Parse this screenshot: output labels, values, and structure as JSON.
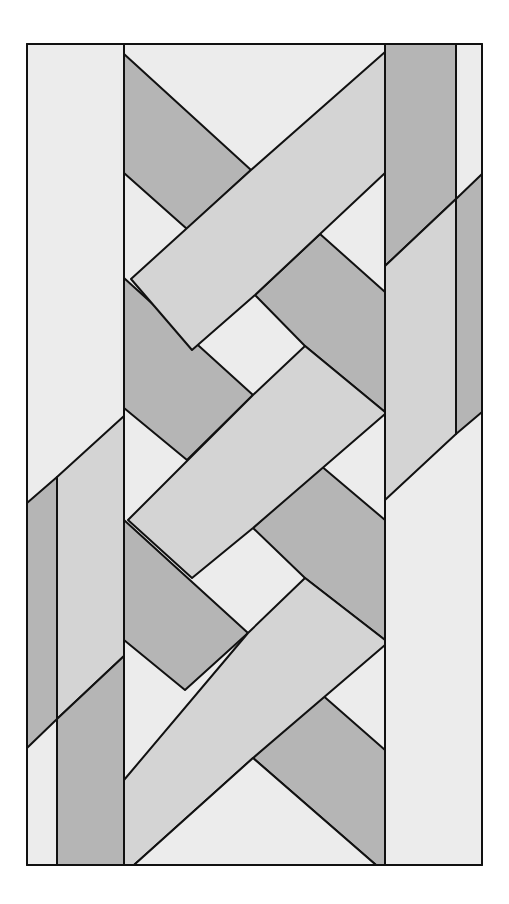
{
  "figure": {
    "title": "",
    "frame": {
      "x": 27,
      "y": 44,
      "width": 455,
      "height": 821
    },
    "colors": {
      "light": "#ececec",
      "medium": "#d4d4d4",
      "dark": "#b5b5b5",
      "line": "#111111",
      "background": "#ffffff"
    },
    "columns": {
      "left_outer": {
        "x1": 27,
        "x2": 124
      },
      "left_stripe_line_x": 57,
      "center": {
        "x1": 124,
        "x2": 385
      },
      "right_outer": {
        "x1": 385,
        "x2": 482
      },
      "right_stripe_line_x": 456
    },
    "shapes": [
      {
        "id": "left-bg",
        "tone": "light",
        "points": "27,44 124,44 124,865 27,865"
      },
      {
        "id": "left-band-dark-top",
        "tone": "dark",
        "points": "27,503 57,477 57,719 27,748"
      },
      {
        "id": "left-band-medium-top",
        "tone": "medium",
        "points": "57,477 124,416 124,656 57,719"
      },
      {
        "id": "left-band-dark-bottom",
        "tone": "dark",
        "points": "57,719 124,656 124,865 57,865"
      },
      {
        "id": "right-bg",
        "tone": "light",
        "points": "385,44 482,44 482,865 385,865"
      },
      {
        "id": "right-band-dark",
        "tone": "dark",
        "points": "385,44 456,44 456,199 385,266"
      },
      {
        "id": "right-band-dark-thin",
        "tone": "dark",
        "points": "456,199 482,174 482,412 456,434"
      },
      {
        "id": "right-band-medium",
        "tone": "medium",
        "points": "385,266 456,199 456,434 385,500"
      },
      {
        "id": "center-bg",
        "tone": "light",
        "points": "124,44 385,44 385,865 124,865"
      },
      {
        "id": "dark-tl",
        "tone": "dark",
        "points": "124,54 251,170 187,229 124,173"
      },
      {
        "id": "band-a",
        "tone": "medium",
        "points": "385,52 385,173 255,295 192,350 131,279 251,170"
      },
      {
        "id": "dark-r1",
        "tone": "dark",
        "points": "320,234 385,292 385,412 305,346 255,295"
      },
      {
        "id": "dark-l2",
        "tone": "dark",
        "points": "124,278 253,395 187,460 124,408"
      },
      {
        "id": "band-b",
        "tone": "medium",
        "points": "305,346 385,412 385,414 253,528 192,578 128,520 253,395"
      },
      {
        "id": "dark-r2",
        "tone": "dark",
        "points": "320,465 385,520 385,640 305,578 253,528"
      },
      {
        "id": "dark-l3",
        "tone": "dark",
        "points": "124,520 248,633 185,690 124,640"
      },
      {
        "id": "band-c",
        "tone": "medium",
        "points": "305,578 385,640 385,645 253,758 134,865 124,865 124,780 248,633"
      },
      {
        "id": "dark-r3",
        "tone": "dark",
        "points": "320,693 385,750 385,865 376,865 253,758"
      },
      {
        "id": "bottom-triangle",
        "tone": "light",
        "points": "134,865 253,758 376,865"
      }
    ]
  }
}
